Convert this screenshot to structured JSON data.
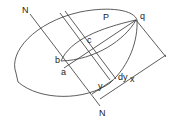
{
  "diagram": {
    "labels": {
      "N_top": "N",
      "N_bottom": "N",
      "P": "P",
      "q": "q",
      "c": "c",
      "b": "b",
      "a": "a",
      "y": "y",
      "dy": "dy",
      "x": "x"
    },
    "colors": {
      "line": "#333333",
      "background": "#ffffff"
    }
  }
}
